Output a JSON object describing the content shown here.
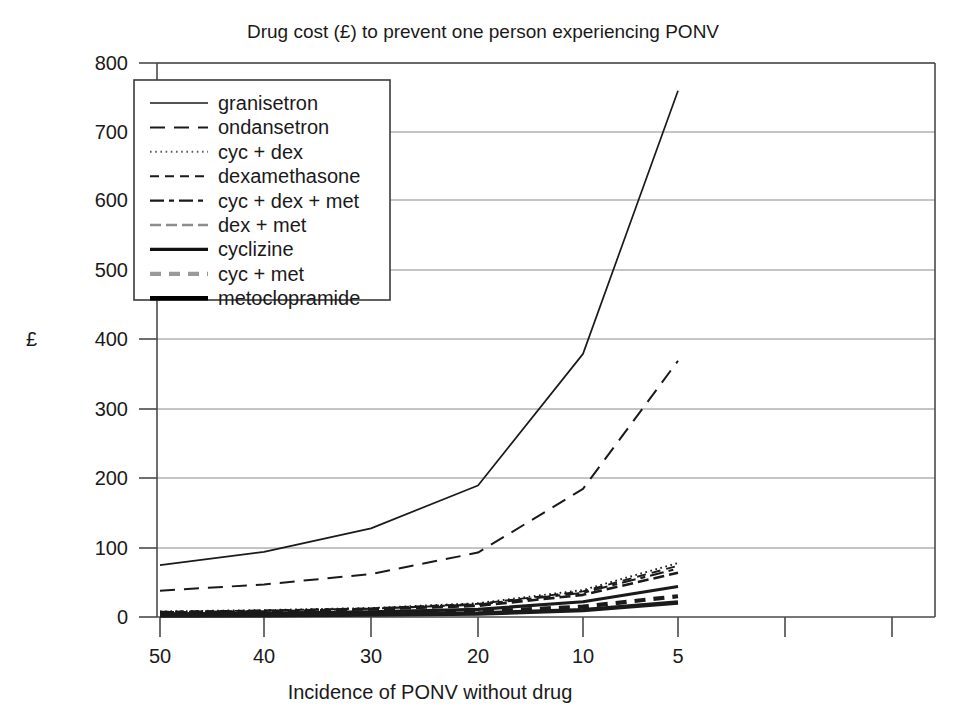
{
  "chart_data": {
    "type": "line",
    "title": "Drug cost (£) to prevent one person experiencing PONV",
    "xlabel": "Incidence of PONV without drug",
    "ylabel": "£",
    "x": [
      50,
      40,
      30,
      20,
      10,
      5
    ],
    "xtick_labels": [
      "50",
      "40",
      "30",
      "20",
      "10",
      "5"
    ],
    "ytick_labels": [
      "0",
      "100",
      "200",
      "300",
      "400",
      "500",
      "600",
      "700",
      "800"
    ],
    "ylim": [
      0,
      800
    ],
    "ytick_step": 100,
    "grid": "horizontal",
    "legend_position": "upper-left-inside",
    "series": [
      {
        "name": "granisetron",
        "style": "solid-thin",
        "values": [
          75,
          94,
          128,
          190,
          380,
          760
        ]
      },
      {
        "name": "ondansetron",
        "style": "long-dash",
        "values": [
          38,
          47,
          62,
          93,
          185,
          370
        ]
      },
      {
        "name": "cyc + dex",
        "style": "dotted",
        "values": [
          8,
          10,
          13,
          20,
          39,
          78
        ]
      },
      {
        "name": "dexamethasone",
        "style": "dashed",
        "values": [
          7.5,
          9.4,
          12.5,
          19,
          37,
          74
        ]
      },
      {
        "name": "cyc + dex + met",
        "style": "dash-dot",
        "values": [
          7,
          9,
          12,
          18,
          35,
          70
        ]
      },
      {
        "name": "dex + met",
        "style": "fine-dash-gray",
        "values": [
          6.5,
          8,
          11,
          16,
          32,
          64
        ]
      },
      {
        "name": "cyclizine",
        "style": "solid-thick",
        "values": [
          4.5,
          5.5,
          7.5,
          11,
          22,
          44
        ]
      },
      {
        "name": "cyc + met",
        "style": "thick-dash-gray",
        "values": [
          3,
          3.8,
          5,
          7.5,
          15,
          30
        ]
      },
      {
        "name": "metoclopramide",
        "style": "solid-extra-thick",
        "values": [
          2,
          2.5,
          3.4,
          5,
          10,
          21
        ]
      }
    ]
  },
  "axes": {
    "title": "Drug cost (£) to prevent one person experiencing PONV",
    "x_axis_label": "Incidence of PONV without drug",
    "y_axis_label": "£",
    "y_ticks": [
      "800",
      "700",
      "600",
      "500",
      "400",
      "300",
      "200",
      "100",
      "0"
    ],
    "x_ticks": [
      "50",
      "40",
      "30",
      "20",
      "10",
      "5"
    ]
  },
  "legend": {
    "items": [
      {
        "label": "granisetron",
        "swatch": "legend-swatch-granisetron"
      },
      {
        "label": "ondansetron",
        "swatch": "legend-swatch-ondansetron"
      },
      {
        "label": "cyc + dex",
        "swatch": "legend-swatch-cyc-dex"
      },
      {
        "label": "dexamethasone",
        "swatch": "legend-swatch-dexamethasone"
      },
      {
        "label": "cyc + dex + met",
        "swatch": "legend-swatch-cyc-dex-met"
      },
      {
        "label": "dex + met",
        "swatch": "legend-swatch-dex-met"
      },
      {
        "label": "cyclizine",
        "swatch": "legend-swatch-cyclizine"
      },
      {
        "label": "cyc + met",
        "swatch": "legend-swatch-cyc-met"
      },
      {
        "label": "metoclopramide",
        "swatch": "legend-swatch-metoclopramide"
      }
    ]
  },
  "colors": {
    "ink": "#1a1a1a",
    "grid": "#8a8a8a",
    "frame": "#4a4a4a",
    "gray_series": "#7d7d7d",
    "background": "#ffffff"
  }
}
